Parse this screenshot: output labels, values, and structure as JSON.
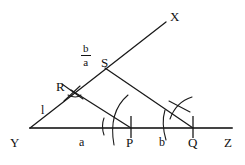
{
  "figure": {
    "type": "euclidean-construction-diagram",
    "stroke_color": "#1a1a1a",
    "baseline_color": "#444444",
    "background_color": "#ffffff"
  },
  "points": [
    {
      "id": "Y",
      "label": "Y",
      "x": 30,
      "y": 128,
      "label_x": 10,
      "label_y": 136
    },
    {
      "id": "Z",
      "label": "Z",
      "x": 232,
      "y": 128,
      "label_x": 224,
      "label_y": 136
    },
    {
      "id": "X",
      "label": "X",
      "x": 166,
      "y": 22,
      "label_x": 170,
      "label_y": 10
    },
    {
      "id": "R",
      "label": "R",
      "x": 71,
      "y": 90,
      "label_x": 56,
      "label_y": 80
    },
    {
      "id": "S",
      "label": "S",
      "x": 105,
      "y": 68,
      "label_x": 101,
      "label_y": 56
    },
    {
      "id": "P",
      "label": "P",
      "x": 131,
      "y": 128,
      "label_x": 126,
      "label_y": 136
    },
    {
      "id": "Q",
      "label": "Q",
      "x": 193,
      "y": 128,
      "label_x": 188,
      "label_y": 136
    }
  ],
  "segment_labels": [
    {
      "id": "unit-l",
      "label": "l",
      "x": 41,
      "y": 104
    },
    {
      "id": "base-a",
      "label": "a",
      "x": 79,
      "y": 136
    },
    {
      "id": "base-b",
      "label": "b",
      "x": 159,
      "y": 136
    }
  ],
  "fraction_label": {
    "id": "ratio-b-over-a",
    "numerator": "b",
    "denominator": "a",
    "x": 81,
    "y": 43
  },
  "lines": [
    {
      "id": "base-line-YZ",
      "from": "Y",
      "to": "Z",
      "kind": "baseline"
    },
    {
      "id": "ray-YX",
      "from": "Y",
      "to": "X",
      "kind": "ray"
    },
    {
      "id": "segment-RP",
      "from": "R",
      "to": "P",
      "kind": "segment"
    },
    {
      "id": "segment-SQ",
      "from": "S",
      "to": "Q",
      "kind": "segment"
    }
  ],
  "ticks": [
    {
      "id": "tick-P",
      "x": 131,
      "y_top": 116,
      "y_bottom": 138
    },
    {
      "id": "tick-Q",
      "x": 193,
      "y_top": 116,
      "y_bottom": 138
    }
  ],
  "construction_arcs": [
    {
      "id": "arc-R-cross-1",
      "d": "M 62 84 L 83 99"
    },
    {
      "id": "arc-R-cross-2",
      "d": "M 80 86 L 64 101"
    },
    {
      "id": "arc-R-small",
      "d": "M 68 95 Q 76 99 81 95"
    },
    {
      "id": "arc-P-big",
      "d": "M 128 95 Q 108 112 114 145"
    },
    {
      "id": "arc-P-small",
      "d": "M 104 118 Q 101 126 104 135"
    },
    {
      "id": "arc-Q-upper",
      "d": "M 170 119 Q 176 102 192 97"
    },
    {
      "id": "arc-Q-cross",
      "d": "M 169 101 L 190 112"
    },
    {
      "id": "arc-Q-low",
      "d": "M 165 110 Q 161 123 166 140"
    }
  ]
}
